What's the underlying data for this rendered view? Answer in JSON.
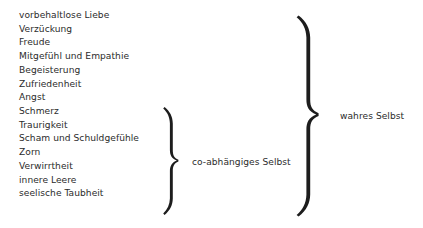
{
  "diagram": {
    "language": "de",
    "ink_color": "#2b2b2b",
    "background_color": "#ffffff",
    "items": [
      {
        "label": "vorbehaltlose Liebe"
      },
      {
        "label": "Verzückung"
      },
      {
        "label": "Freude"
      },
      {
        "label": "Mitgefühl und Empathie"
      },
      {
        "label": "Begeisterung"
      },
      {
        "label": "Zufriedenheit"
      },
      {
        "label": "Angst"
      },
      {
        "label": "Schmerz"
      },
      {
        "label": "Traurigkeit"
      },
      {
        "label": "Scham und Schuldgefühle"
      },
      {
        "label": "Zorn"
      },
      {
        "label": "Verwirrtheit"
      },
      {
        "label": "innere Leere"
      },
      {
        "label": "seelische Taubheit"
      }
    ],
    "groups": [
      {
        "id": "codependent-self",
        "label": "co-abhängiges Selbst",
        "covers_items": [
          6,
          7,
          8,
          9,
          10,
          11,
          12,
          13
        ]
      },
      {
        "id": "true-self",
        "label": "wahres Selbst",
        "covers_items": [
          0,
          1,
          2,
          3,
          4,
          5,
          6,
          7,
          8,
          9,
          10,
          11,
          12,
          13
        ]
      }
    ]
  }
}
